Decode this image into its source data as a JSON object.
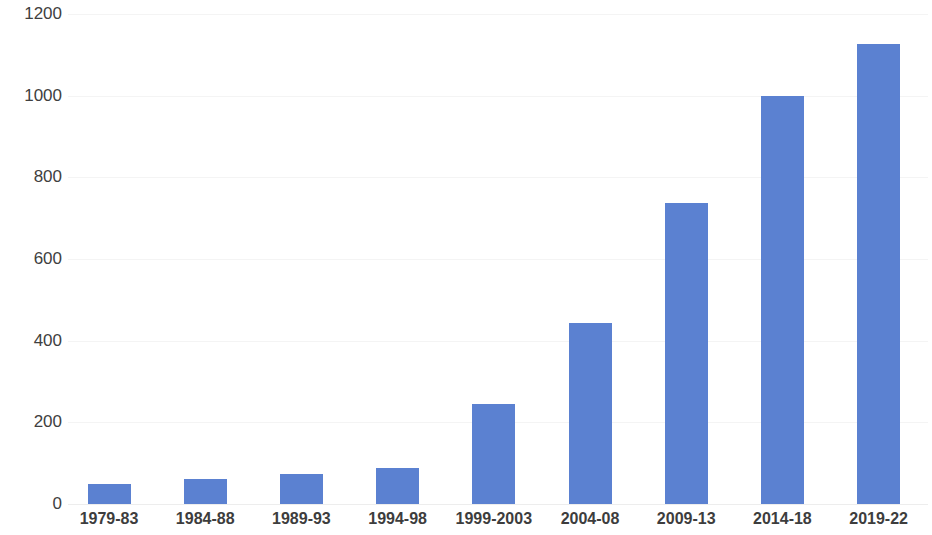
{
  "chart_data": {
    "type": "bar",
    "title": "",
    "subtitle": "",
    "xlabel": "",
    "ylabel": "",
    "categories": [
      "1979-83",
      "1984-88",
      "1989-93",
      "1994-98",
      "1999-2003",
      "2004-08",
      "2009-13",
      "2014-18",
      "2019-22"
    ],
    "values": [
      48,
      61,
      74,
      88,
      245,
      443,
      737,
      1000,
      1127
    ],
    "series": [
      {
        "name": "",
        "values": [
          48,
          61,
          74,
          88,
          245,
          443,
          737,
          1000,
          1127
        ],
        "color": "#5b81d1"
      }
    ],
    "ylim": [
      0,
      1200
    ],
    "yticks": [
      0,
      200,
      400,
      600,
      800,
      1000,
      1200
    ],
    "ytick_labels": [
      "0",
      "200",
      "400",
      "600",
      "800",
      "1000",
      "1200"
    ],
    "grid": true,
    "grid_axis": "y",
    "legend": false,
    "legend_position": "none",
    "bar_color": "#5b81d1",
    "grid_color": "#f4f4f4",
    "axis_text_color": "#3d3d3d"
  }
}
